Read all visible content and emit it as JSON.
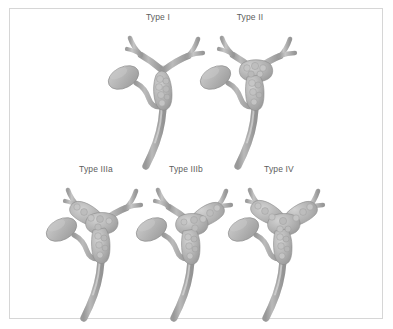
{
  "figure": {
    "background_color": "#ffffff",
    "frame_color": "#d6d6d6",
    "label_color": "#5d5d5d",
    "duct_fill": "#b3b3b3",
    "duct_shade": "#9a9a9a",
    "duct_highlight": "#cfcfcf",
    "gallbladder_fill": "#b6b6b6",
    "tumor_fill": "#a8a8a8",
    "tumor_nodule": "#bdbdbd",
    "outline_color": "#8f8f8f"
  },
  "panels": [
    {
      "id": "type-1",
      "label": "Type I",
      "tumor_regions": [
        "common hepatic duct below confluence"
      ],
      "confluence_involved": false,
      "right_hepatic_duct_involved": false,
      "left_hepatic_duct_involved": false
    },
    {
      "id": "type-2",
      "label": "Type II",
      "tumor_regions": [
        "common hepatic duct",
        "hepatic duct confluence"
      ],
      "confluence_involved": true,
      "right_hepatic_duct_involved": false,
      "left_hepatic_duct_involved": false
    },
    {
      "id": "type-3a",
      "label": "Type IIIa",
      "tumor_regions": [
        "common hepatic duct",
        "hepatic duct confluence",
        "right hepatic duct"
      ],
      "confluence_involved": true,
      "right_hepatic_duct_involved": true,
      "left_hepatic_duct_involved": false
    },
    {
      "id": "type-3b",
      "label": "Type IIIb",
      "tumor_regions": [
        "common hepatic duct",
        "hepatic duct confluence",
        "left hepatic duct"
      ],
      "confluence_involved": true,
      "right_hepatic_duct_involved": false,
      "left_hepatic_duct_involved": true
    },
    {
      "id": "type-4",
      "label": "Type IV",
      "tumor_regions": [
        "common hepatic duct",
        "hepatic duct confluence",
        "right hepatic duct",
        "left hepatic duct"
      ],
      "confluence_involved": true,
      "right_hepatic_duct_involved": true,
      "left_hepatic_duct_involved": true
    }
  ]
}
